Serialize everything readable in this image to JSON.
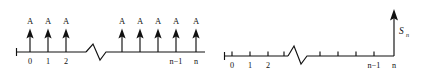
{
  "figure": {
    "ink_color": "#111111",
    "background_color": "#ffffff"
  },
  "left_panel": {
    "name": "impulse-train-axis",
    "axis": {
      "x_start": 16,
      "x_end": 205,
      "y": 52,
      "break_start_x": 86,
      "break_end_x": 112
    },
    "amplitude_label": "A",
    "impulses": [
      {
        "label": "A",
        "tick_label": "0",
        "x": 30
      },
      {
        "label": "A",
        "tick_label": "1",
        "x": 48
      },
      {
        "label": "A",
        "tick_label": "2",
        "x": 66
      },
      {
        "label": "A",
        "tick_label": "",
        "x": 122
      },
      {
        "label": "A",
        "tick_label": "",
        "x": 140
      },
      {
        "label": "A",
        "tick_label": "",
        "x": 158
      },
      {
        "label": "A",
        "tick_label": "n−1",
        "x": 176
      },
      {
        "label": "A",
        "tick_label": "n",
        "x": 196
      }
    ],
    "tick_labels_shown": [
      "0",
      "1",
      "2",
      "n−1",
      "n"
    ]
  },
  "right_panel": {
    "name": "accumulated-sum-axis",
    "axis": {
      "x_start": 224,
      "x_end": 394,
      "y": 56,
      "break_start_x": 288,
      "break_end_x": 312
    },
    "ticks": [
      {
        "tick_label": "0",
        "x": 232
      },
      {
        "tick_label": "1",
        "x": 250
      },
      {
        "tick_label": "2",
        "x": 268
      },
      {
        "tick_label": "",
        "x": 284
      },
      {
        "tick_label": "",
        "x": 320
      },
      {
        "tick_label": "",
        "x": 338
      },
      {
        "tick_label": "",
        "x": 356
      },
      {
        "tick_label": "n−1",
        "x": 374
      },
      {
        "tick_label": "n",
        "x": 394
      }
    ],
    "sum_arrow": {
      "x": 394,
      "top_y": 10,
      "label_base": "S",
      "label_subscript": "n"
    },
    "tick_labels_shown": [
      "0",
      "1",
      "2",
      "n−1",
      "n"
    ]
  }
}
